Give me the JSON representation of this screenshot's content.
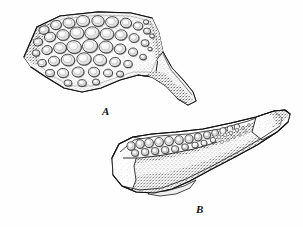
{
  "figure": {
    "caption_labels": [
      {
        "id": "A",
        "text": "A",
        "x": 102,
        "y": 106
      },
      {
        "id": "B",
        "text": "B",
        "x": 196,
        "y": 204
      }
    ],
    "background_color": "#fefefe",
    "ink_color": "#1a1a1a",
    "shade_color": "#6b6b6b",
    "tone_color": "#bdbdbd",
    "style": "pen-and-ink stipple and hatch line drawing"
  },
  "chart_data": {
    "type": "scatter",
    "title": "",
    "specimens": [
      {
        "label": "A",
        "view": "occlusal view of tooth plate with posterior process",
        "bbox": [
          18,
          10,
          196,
          106
        ],
        "outline": "M 24,57 L 37,27 L 60,16 L 98,12 L 131,13 L 152,18 L 159,33 L 163,52 L 172,68 L 184,81 L 193,92 L 196,101 L 188,105 L 178,99 L 166,86 L 152,77 L 138,75 L 120,80 L 101,88 L 82,92 L 64,88 L 46,77 L 31,67 Z",
        "tooth_count": 46,
        "teeth": [
          {
            "cx": 44,
            "cy": 30,
            "rx": 5.0,
            "ry": 4.2,
            "rot": -15
          },
          {
            "cx": 56,
            "cy": 25,
            "rx": 5.4,
            "ry": 4.6,
            "rot": -10
          },
          {
            "cx": 69,
            "cy": 23,
            "rx": 6.0,
            "ry": 5.0,
            "rot": 5
          },
          {
            "cx": 83,
            "cy": 21,
            "rx": 6.6,
            "ry": 5.6,
            "rot": 0
          },
          {
            "cx": 98,
            "cy": 21,
            "rx": 6.2,
            "ry": 5.4,
            "rot": 8
          },
          {
            "cx": 112,
            "cy": 22,
            "rx": 6.4,
            "ry": 5.4,
            "rot": -5
          },
          {
            "cx": 126,
            "cy": 23,
            "rx": 5.6,
            "ry": 4.8,
            "rot": 10
          },
          {
            "cx": 138,
            "cy": 26,
            "rx": 4.8,
            "ry": 4.0,
            "rot": 0
          },
          {
            "cx": 147,
            "cy": 31,
            "rx": 3.6,
            "ry": 3.0,
            "rot": 0
          },
          {
            "cx": 38,
            "cy": 42,
            "rx": 4.4,
            "ry": 3.8,
            "rot": -20
          },
          {
            "cx": 50,
            "cy": 37,
            "rx": 5.6,
            "ry": 4.8,
            "rot": -12
          },
          {
            "cx": 63,
            "cy": 35,
            "rx": 6.2,
            "ry": 5.4,
            "rot": 0
          },
          {
            "cx": 77,
            "cy": 33,
            "rx": 7.0,
            "ry": 6.0,
            "rot": 5
          },
          {
            "cx": 92,
            "cy": 33,
            "rx": 7.2,
            "ry": 6.2,
            "rot": -5
          },
          {
            "cx": 107,
            "cy": 34,
            "rx": 6.8,
            "ry": 5.8,
            "rot": 6
          },
          {
            "cx": 121,
            "cy": 35,
            "rx": 6.0,
            "ry": 5.2,
            "rot": -8
          },
          {
            "cx": 134,
            "cy": 38,
            "rx": 5.0,
            "ry": 4.4,
            "rot": 0
          },
          {
            "cx": 145,
            "cy": 43,
            "rx": 4.0,
            "ry": 3.4,
            "rot": 0
          },
          {
            "cx": 36,
            "cy": 53,
            "rx": 3.8,
            "ry": 3.2,
            "rot": 0
          },
          {
            "cx": 47,
            "cy": 50,
            "rx": 5.2,
            "ry": 4.4,
            "rot": -15
          },
          {
            "cx": 60,
            "cy": 48,
            "rx": 6.4,
            "ry": 5.4,
            "rot": 0
          },
          {
            "cx": 74,
            "cy": 47,
            "rx": 7.4,
            "ry": 6.4,
            "rot": 10
          },
          {
            "cx": 90,
            "cy": 46,
            "rx": 7.6,
            "ry": 6.6,
            "rot": -6
          },
          {
            "cx": 106,
            "cy": 47,
            "rx": 7.0,
            "ry": 6.0,
            "rot": 4
          },
          {
            "cx": 120,
            "cy": 49,
            "rx": 5.8,
            "ry": 5.0,
            "rot": -10
          },
          {
            "cx": 133,
            "cy": 52,
            "rx": 4.6,
            "ry": 4.0,
            "rot": 0
          },
          {
            "cx": 143,
            "cy": 57,
            "rx": 3.4,
            "ry": 2.8,
            "rot": 0
          },
          {
            "cx": 42,
            "cy": 63,
            "rx": 4.2,
            "ry": 3.6,
            "rot": -10
          },
          {
            "cx": 54,
            "cy": 61,
            "rx": 5.6,
            "ry": 4.8,
            "rot": 0
          },
          {
            "cx": 68,
            "cy": 60,
            "rx": 6.8,
            "ry": 5.8,
            "rot": 8
          },
          {
            "cx": 84,
            "cy": 59,
            "rx": 7.2,
            "ry": 6.2,
            "rot": -4
          },
          {
            "cx": 100,
            "cy": 60,
            "rx": 6.6,
            "ry": 5.6,
            "rot": 6
          },
          {
            "cx": 115,
            "cy": 62,
            "rx": 5.4,
            "ry": 4.6,
            "rot": -8
          },
          {
            "cx": 128,
            "cy": 64,
            "rx": 4.2,
            "ry": 3.6,
            "rot": 0
          },
          {
            "cx": 50,
            "cy": 73,
            "rx": 4.4,
            "ry": 3.6,
            "rot": 0
          },
          {
            "cx": 63,
            "cy": 73,
            "rx": 5.6,
            "ry": 4.6,
            "rot": 5
          },
          {
            "cx": 78,
            "cy": 72,
            "rx": 6.0,
            "ry": 5.0,
            "rot": -6
          },
          {
            "cx": 94,
            "cy": 72,
            "rx": 5.6,
            "ry": 4.8,
            "rot": 4
          },
          {
            "cx": 108,
            "cy": 73,
            "rx": 4.6,
            "ry": 3.8,
            "rot": 0
          },
          {
            "cx": 120,
            "cy": 74,
            "rx": 3.6,
            "ry": 3.0,
            "rot": 0
          },
          {
            "cx": 68,
            "cy": 83,
            "rx": 4.0,
            "ry": 3.2,
            "rot": 0
          },
          {
            "cx": 82,
            "cy": 83,
            "rx": 4.2,
            "ry": 3.4,
            "rot": 0
          },
          {
            "cx": 96,
            "cy": 82,
            "rx": 3.6,
            "ry": 3.0,
            "rot": 0
          },
          {
            "cx": 146,
            "cy": 22,
            "rx": 2.6,
            "ry": 2.2,
            "rot": 0
          },
          {
            "cx": 152,
            "cy": 36,
            "rx": 2.4,
            "ry": 2.0,
            "rot": 0
          },
          {
            "cx": 150,
            "cy": 49,
            "rx": 2.2,
            "ry": 1.8,
            "rot": 0
          }
        ],
        "posterior_process": "tapering downturned process at lower right"
      },
      {
        "label": "B",
        "view": "lateral / oblique view of elongate jaw with tooth row",
        "bbox": [
          108,
          108,
          291,
          200
        ],
        "outline": "M 112,158 L 119,144 L 133,137 L 152,134 L 176,132 L 203,129 L 231,123 L 256,117 L 274,111 L 285,110 L 290,114 L 288,122 L 277,132 L 257,145 L 233,158 L 210,170 L 190,181 L 172,189 L 154,193 L 136,192 L 122,186 L 113,175 Z",
        "tooth_count": 26,
        "teeth": [
          {
            "cx": 131,
            "cy": 146,
            "rx": 4.0,
            "ry": 4.2,
            "rot": 0
          },
          {
            "cx": 140,
            "cy": 144,
            "rx": 4.2,
            "ry": 4.4,
            "rot": 0
          },
          {
            "cx": 149,
            "cy": 143,
            "rx": 4.4,
            "ry": 4.6,
            "rot": 0
          },
          {
            "cx": 159,
            "cy": 142,
            "rx": 4.4,
            "ry": 4.6,
            "rot": 0
          },
          {
            "cx": 169,
            "cy": 141,
            "rx": 4.4,
            "ry": 4.6,
            "rot": 0
          },
          {
            "cx": 179,
            "cy": 140,
            "rx": 4.2,
            "ry": 4.4,
            "rot": 0
          },
          {
            "cx": 189,
            "cy": 139,
            "rx": 4.0,
            "ry": 4.2,
            "rot": 0
          },
          {
            "cx": 198,
            "cy": 137,
            "rx": 3.8,
            "ry": 4.0,
            "rot": 0
          },
          {
            "cx": 207,
            "cy": 135,
            "rx": 3.6,
            "ry": 3.8,
            "rot": 0
          },
          {
            "cx": 215,
            "cy": 133,
            "rx": 3.4,
            "ry": 3.6,
            "rot": 0
          },
          {
            "cx": 223,
            "cy": 131,
            "rx": 3.2,
            "ry": 3.4,
            "rot": 0
          },
          {
            "cx": 230,
            "cy": 129,
            "rx": 3.0,
            "ry": 3.2,
            "rot": 0
          },
          {
            "cx": 237,
            "cy": 127,
            "rx": 2.8,
            "ry": 3.0,
            "rot": 0
          },
          {
            "cx": 135,
            "cy": 153,
            "rx": 3.6,
            "ry": 3.4,
            "rot": 0
          },
          {
            "cx": 145,
            "cy": 152,
            "rx": 3.8,
            "ry": 3.6,
            "rot": 0
          },
          {
            "cx": 155,
            "cy": 151,
            "rx": 3.8,
            "ry": 3.6,
            "rot": 0
          },
          {
            "cx": 165,
            "cy": 150,
            "rx": 3.8,
            "ry": 3.6,
            "rot": 0
          },
          {
            "cx": 175,
            "cy": 149,
            "rx": 3.6,
            "ry": 3.4,
            "rot": 0
          },
          {
            "cx": 185,
            "cy": 147,
            "rx": 3.4,
            "ry": 3.2,
            "rot": 0
          },
          {
            "cx": 195,
            "cy": 145,
            "rx": 3.2,
            "ry": 3.0,
            "rot": 0
          },
          {
            "cx": 204,
            "cy": 143,
            "rx": 3.0,
            "ry": 2.8,
            "rot": 0
          },
          {
            "cx": 213,
            "cy": 140,
            "rx": 2.8,
            "ry": 2.6,
            "rot": 0
          },
          {
            "cx": 221,
            "cy": 137,
            "rx": 2.6,
            "ry": 2.4,
            "rot": 0
          },
          {
            "cx": 229,
            "cy": 135,
            "rx": 2.4,
            "ry": 2.2,
            "rot": 0
          },
          {
            "cx": 236,
            "cy": 132,
            "rx": 2.2,
            "ry": 2.0,
            "rot": 0
          },
          {
            "cx": 243,
            "cy": 130,
            "rx": 2.0,
            "ry": 1.8,
            "rot": 0
          }
        ],
        "posterior_process": "long tapering ramus extending to upper right"
      }
    ]
  }
}
